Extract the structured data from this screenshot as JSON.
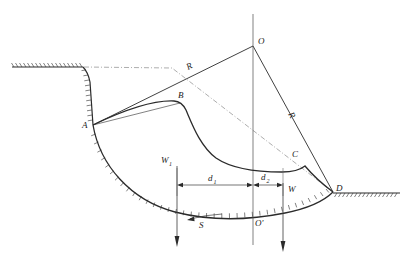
{
  "figure": {
    "points": {
      "O": "O",
      "O_prime": "O'",
      "A": "A",
      "B": "B",
      "C": "C",
      "D": "D"
    },
    "radii": {
      "R_upper": "R",
      "R_lower": "R"
    },
    "forces": {
      "W1": "W",
      "W1_sub": "1",
      "W": "W",
      "S": "S"
    },
    "dimensions": {
      "d1": "d",
      "d1_sub": "1",
      "d2": "d",
      "d2_sub": "2"
    },
    "colors": {
      "line": "#2b2b2b",
      "thin": "#4a4a4a",
      "dashed": "#8a8a8a",
      "background": "#ffffff"
    }
  }
}
